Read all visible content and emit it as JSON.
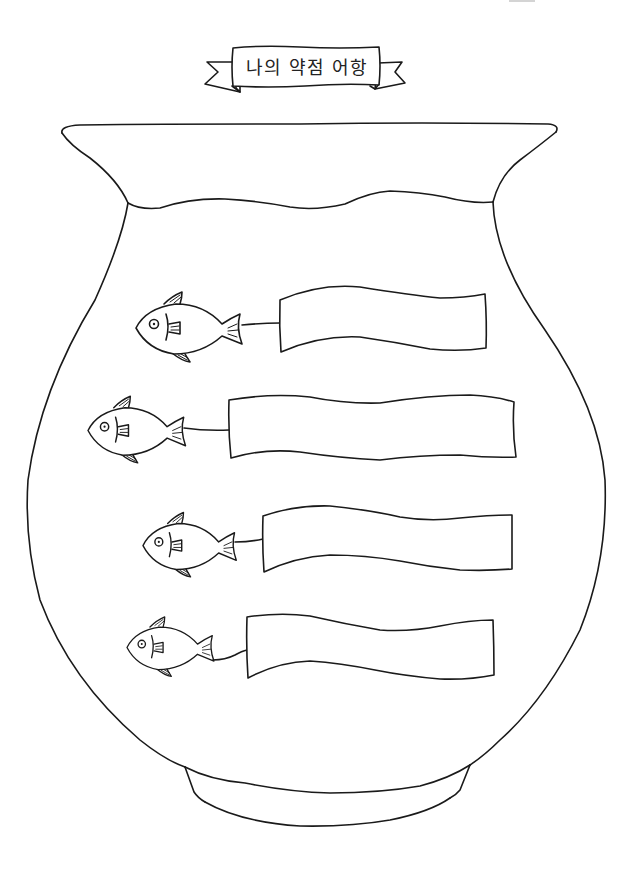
{
  "worksheet": {
    "title": "나의 약점 어항",
    "colors": {
      "ink": "#1a1a1a",
      "paper": "#ffffff"
    },
    "vase": {
      "description": "fishbowl-vase outline with wavy water line and foot"
    },
    "fish_rows": [
      {
        "index": 1,
        "icon": "fish-icon",
        "banner_value": "",
        "banner_placeholder": ""
      },
      {
        "index": 2,
        "icon": "fish-icon",
        "banner_value": "",
        "banner_placeholder": ""
      },
      {
        "index": 3,
        "icon": "fish-icon",
        "banner_value": "",
        "banner_placeholder": ""
      },
      {
        "index": 4,
        "icon": "fish-icon",
        "banner_value": "",
        "banner_placeholder": ""
      }
    ]
  }
}
